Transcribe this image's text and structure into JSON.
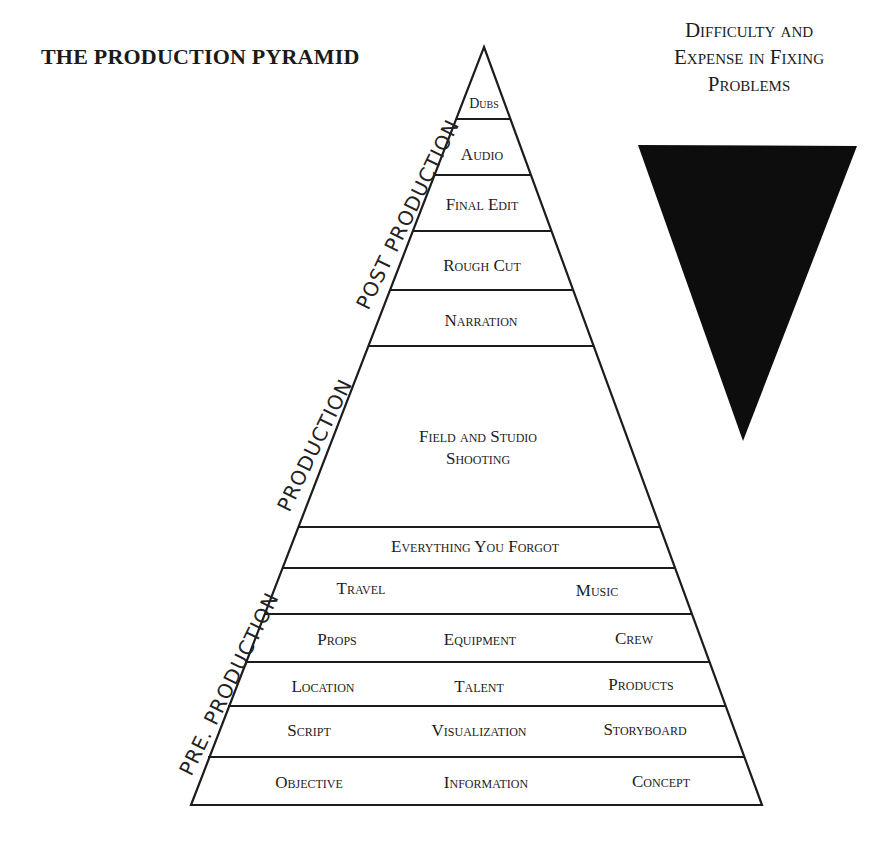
{
  "title": "THE PRODUCTION PYRAMID",
  "difficulty_label": {
    "line1": "Difficulty and",
    "line2": "Expense in Fixing",
    "line3": "Problems"
  },
  "colors": {
    "ink": "#1c1c1c",
    "triangle_fill": "#0d0d0d",
    "background": "#ffffff"
  },
  "phases": {
    "post": "POST PRODUCTION",
    "production": "PRODUCTION",
    "pre": "PRE. PRODUCTION"
  },
  "pyramid": {
    "dubs": "Dubs",
    "audio": "Audio",
    "final_edit": "Final Edit",
    "rough_cut": "Rough Cut",
    "narration": "Narration",
    "shooting_line1": "Field and Studio",
    "shooting_line2": "Shooting",
    "everything_forgot": "Everything You Forgot",
    "travel": "Travel",
    "music": "Music",
    "props": "Props",
    "equipment": "Equipment",
    "crew": "Crew",
    "location": "Location",
    "talent": "Talent",
    "products": "Products",
    "script": "Script",
    "visualization": "Visualization",
    "storyboard": "Storyboard",
    "objective": "Objective",
    "information": "Information",
    "concept": "Concept"
  }
}
